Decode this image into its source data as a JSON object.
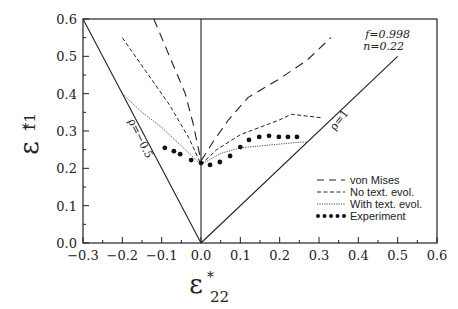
{
  "chart_data": {
    "type": "line",
    "title": "",
    "xlabel": "ε*22",
    "ylabel": "ε*11",
    "xlabel_main": "ε",
    "xlabel_sup": "*",
    "xlabel_sub": "22",
    "ylabel_main": "ε",
    "ylabel_sup": "*",
    "ylabel_sub": "11",
    "xlim": [
      -0.3,
      0.6
    ],
    "ylim": [
      0.0,
      0.6
    ],
    "xticks": [
      "−0.3",
      "−0.2",
      "−0.1",
      "0.0",
      "0.1",
      "0.2",
      "0.3",
      "0.4",
      "0.5",
      "0.6"
    ],
    "yticks": [
      "0.0",
      "0.1",
      "0.2",
      "0.3",
      "0.4",
      "0.5",
      "0.6"
    ],
    "grid": false,
    "legend_position": "lower right",
    "annotations": {
      "params_line1": "f=0.998",
      "params_line2": "n=0.22",
      "rho_neg": "ρ=−0.5",
      "rho_pos": "ρ=1"
    },
    "reference_lines": [
      {
        "name": "rho=-0.5",
        "points": [
          [
            0.0,
            0.0
          ],
          [
            -0.3,
            0.6
          ]
        ]
      },
      {
        "name": "rho=1",
        "points": [
          [
            0.0,
            0.0
          ],
          [
            0.5,
            0.5
          ]
        ]
      },
      {
        "name": "uniaxial",
        "points": [
          [
            0.0,
            0.0
          ],
          [
            0.0,
            0.6
          ]
        ]
      }
    ],
    "series": [
      {
        "name": "von Mises",
        "style": "long-dash",
        "left_branch": [
          [
            -0.12,
            0.6
          ],
          [
            -0.08,
            0.5
          ],
          [
            -0.04,
            0.4
          ],
          [
            -0.02,
            0.32
          ],
          [
            0.0,
            0.22
          ]
        ],
        "right_branch": [
          [
            0.0,
            0.22
          ],
          [
            0.03,
            0.27
          ],
          [
            0.07,
            0.33
          ],
          [
            0.12,
            0.39
          ],
          [
            0.2,
            0.44
          ],
          [
            0.27,
            0.49
          ],
          [
            0.33,
            0.55
          ]
        ]
      },
      {
        "name": "No text. evol.",
        "style": "short-dash",
        "left_branch": [
          [
            -0.2,
            0.55
          ],
          [
            -0.14,
            0.46
          ],
          [
            -0.08,
            0.37
          ],
          [
            -0.03,
            0.28
          ],
          [
            0.0,
            0.21
          ]
        ],
        "right_branch": [
          [
            0.0,
            0.21
          ],
          [
            0.04,
            0.25
          ],
          [
            0.1,
            0.29
          ],
          [
            0.2,
            0.33
          ],
          [
            0.23,
            0.345
          ],
          [
            0.27,
            0.34
          ],
          [
            0.31,
            0.335
          ]
        ]
      },
      {
        "name": "With text. evol.",
        "style": "dotted",
        "left_branch": [
          [
            -0.2,
            0.4
          ],
          [
            -0.15,
            0.35
          ],
          [
            -0.1,
            0.31
          ],
          [
            -0.05,
            0.26
          ],
          [
            -0.01,
            0.22
          ],
          [
            0.0,
            0.21
          ]
        ],
        "right_branch": [
          [
            0.0,
            0.21
          ],
          [
            0.05,
            0.24
          ],
          [
            0.1,
            0.255
          ],
          [
            0.15,
            0.26
          ],
          [
            0.2,
            0.265
          ],
          [
            0.25,
            0.27
          ],
          [
            0.27,
            0.27
          ]
        ]
      },
      {
        "name": "Experiment",
        "style": "markers",
        "points": [
          [
            -0.092,
            0.255
          ],
          [
            -0.069,
            0.246
          ],
          [
            -0.053,
            0.238
          ],
          [
            -0.025,
            0.222
          ],
          [
            0.0,
            0.214
          ],
          [
            0.023,
            0.209
          ],
          [
            0.048,
            0.217
          ],
          [
            0.074,
            0.233
          ],
          [
            0.1,
            0.257
          ],
          [
            0.122,
            0.276
          ],
          [
            0.148,
            0.284
          ],
          [
            0.173,
            0.287
          ],
          [
            0.198,
            0.284
          ],
          [
            0.221,
            0.284
          ],
          [
            0.244,
            0.284
          ]
        ]
      }
    ]
  },
  "legend": {
    "items": [
      {
        "label": "von Mises"
      },
      {
        "label": "No text. evol."
      },
      {
        "label": "With text. evol."
      },
      {
        "label": "Experiment"
      }
    ]
  }
}
